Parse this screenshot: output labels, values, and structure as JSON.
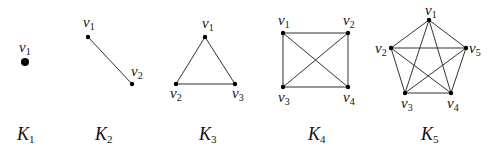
{
  "figure": {
    "graphs": [
      {
        "name": "K",
        "sub": "1",
        "label_pos": [
          25,
          140
        ],
        "vertex_radius": 4,
        "vertices": [
          {
            "id": "v1",
            "base": "v",
            "sub": "1",
            "x": 25,
            "y": 62,
            "lx": 19,
            "ly": 52
          }
        ],
        "edges": []
      },
      {
        "name": "K",
        "sub": "2",
        "label_pos": [
          103,
          140
        ],
        "vertex_radius": 2.2,
        "vertices": [
          {
            "id": "v1",
            "base": "v",
            "sub": "1",
            "x": 88,
            "y": 37,
            "lx": 83,
            "ly": 27
          },
          {
            "id": "v2",
            "base": "v",
            "sub": "2",
            "x": 132,
            "y": 84,
            "lx": 131,
            "ly": 76
          }
        ],
        "edges": [
          [
            "v1",
            "v2"
          ]
        ]
      },
      {
        "name": "K",
        "sub": "3",
        "label_pos": [
          207,
          140
        ],
        "vertex_radius": 2.2,
        "vertices": [
          {
            "id": "v1",
            "base": "v",
            "sub": "1",
            "x": 205,
            "y": 37,
            "lx": 202,
            "ly": 28
          },
          {
            "id": "v2",
            "base": "v",
            "sub": "2",
            "x": 176,
            "y": 84,
            "lx": 170,
            "ly": 98
          },
          {
            "id": "v3",
            "base": "v",
            "sub": "3",
            "x": 235,
            "y": 84,
            "lx": 232,
            "ly": 98
          }
        ],
        "edges": [
          [
            "v1",
            "v2"
          ],
          [
            "v1",
            "v3"
          ],
          [
            "v2",
            "v3"
          ]
        ]
      },
      {
        "name": "K",
        "sub": "4",
        "label_pos": [
          316,
          140
        ],
        "vertex_radius": 2.2,
        "vertices": [
          {
            "id": "v1",
            "base": "v",
            "sub": "1",
            "x": 283,
            "y": 33,
            "lx": 278,
            "ly": 25
          },
          {
            "id": "v2",
            "base": "v",
            "sub": "2",
            "x": 348,
            "y": 33,
            "lx": 343,
            "ly": 25
          },
          {
            "id": "v3",
            "base": "v",
            "sub": "3",
            "x": 283,
            "y": 87,
            "lx": 278,
            "ly": 102
          },
          {
            "id": "v4",
            "base": "v",
            "sub": "4",
            "x": 348,
            "y": 87,
            "lx": 343,
            "ly": 102
          }
        ],
        "edges": [
          [
            "v1",
            "v2"
          ],
          [
            "v1",
            "v3"
          ],
          [
            "v1",
            "v4"
          ],
          [
            "v2",
            "v3"
          ],
          [
            "v2",
            "v4"
          ],
          [
            "v3",
            "v4"
          ]
        ]
      },
      {
        "name": "K",
        "sub": "5",
        "label_pos": [
          429,
          140
        ],
        "vertex_radius": 2.2,
        "vertices": [
          {
            "id": "v1",
            "base": "v",
            "sub": "1",
            "x": 429,
            "y": 20,
            "lx": 425,
            "ly": 15
          },
          {
            "id": "v2",
            "base": "v",
            "sub": "2",
            "x": 391,
            "y": 48,
            "lx": 375,
            "ly": 53
          },
          {
            "id": "v3",
            "base": "v",
            "sub": "3",
            "x": 405,
            "y": 93,
            "lx": 401,
            "ly": 108
          },
          {
            "id": "v4",
            "base": "v",
            "sub": "4",
            "x": 451,
            "y": 93,
            "lx": 447,
            "ly": 108
          },
          {
            "id": "v5",
            "base": "v",
            "sub": "5",
            "x": 466,
            "y": 48,
            "lx": 469,
            "ly": 53
          }
        ],
        "edges": [
          [
            "v1",
            "v2"
          ],
          [
            "v1",
            "v3"
          ],
          [
            "v1",
            "v4"
          ],
          [
            "v1",
            "v5"
          ],
          [
            "v2",
            "v3"
          ],
          [
            "v2",
            "v4"
          ],
          [
            "v2",
            "v5"
          ],
          [
            "v3",
            "v4"
          ],
          [
            "v3",
            "v5"
          ],
          [
            "v4",
            "v5"
          ]
        ]
      }
    ]
  }
}
